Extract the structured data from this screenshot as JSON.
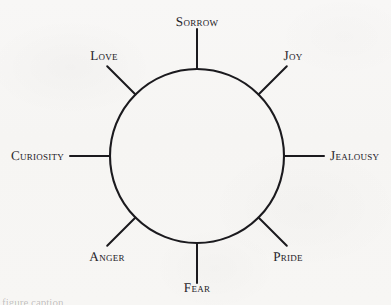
{
  "figure": {
    "kind": "radial-wheel-diagram",
    "background_color": "#f7f6f4",
    "ink_color": "#1b1a1e",
    "text_color": "#26242a",
    "circle": {
      "center_x": 197,
      "center_y": 156,
      "radius": 87,
      "stroke_width": 2.1
    },
    "spoke": {
      "count": 8,
      "inner_radius": 87,
      "outer_radius": 127,
      "stroke_width": 2.0
    },
    "spokes": [
      {
        "name": "sorrow",
        "label": "Sorrow",
        "angle_deg": 270,
        "label_x": 197,
        "label_y": 22,
        "label_anchor": "center"
      },
      {
        "name": "joy",
        "label": "Joy",
        "angle_deg": 315,
        "label_x": 293,
        "label_y": 56,
        "label_anchor": "center"
      },
      {
        "name": "jealousy",
        "label": "Jealousy",
        "angle_deg": 0,
        "label_x": 330,
        "label_y": 156,
        "label_anchor": "left"
      },
      {
        "name": "pride",
        "label": "Pride",
        "angle_deg": 45,
        "label_x": 288,
        "label_y": 257,
        "label_anchor": "center"
      },
      {
        "name": "fear",
        "label": "Fear",
        "angle_deg": 90,
        "label_x": 197,
        "label_y": 288,
        "label_anchor": "center"
      },
      {
        "name": "anger",
        "label": "Anger",
        "angle_deg": 135,
        "label_x": 107,
        "label_y": 257,
        "label_anchor": "center"
      },
      {
        "name": "curiosity",
        "label": "Curiosity",
        "angle_deg": 180,
        "label_x": 64,
        "label_y": 156,
        "label_anchor": "right"
      },
      {
        "name": "love",
        "label": "Love",
        "angle_deg": 225,
        "label_x": 104,
        "label_y": 56,
        "label_anchor": "center"
      }
    ]
  },
  "page_artifacts": {
    "top_cropped_line": "the spokes of the wheel, joy",
    "bottom_cropped_line": "figure caption"
  }
}
